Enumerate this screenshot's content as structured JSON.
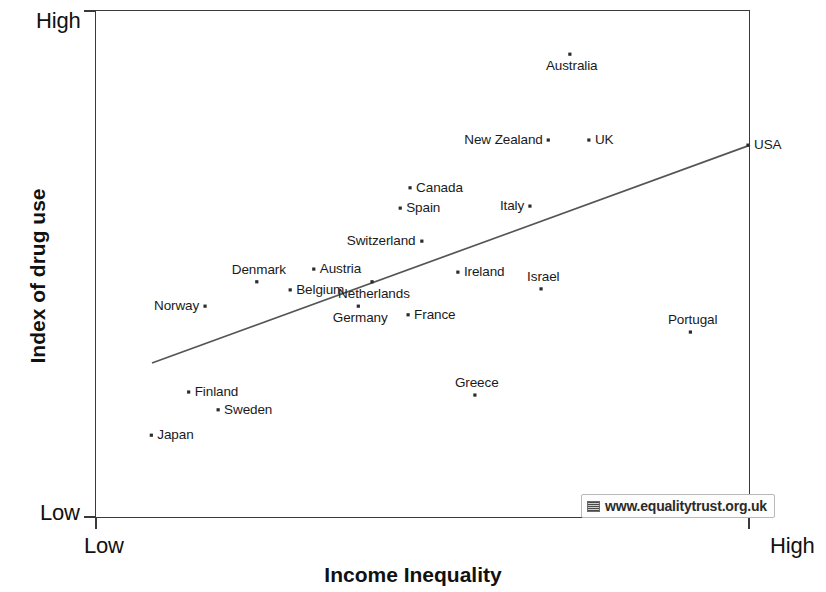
{
  "chart_data": {
    "type": "scatter",
    "title": "",
    "xlabel": "Income Inequality",
    "ylabel": "Index of drug use",
    "x_tick_labels": [
      "Low",
      "High"
    ],
    "y_tick_labels": [
      "High",
      "Low"
    ],
    "xlim": [
      "Low",
      "High"
    ],
    "ylim": [
      "Low",
      "High"
    ],
    "grid": false,
    "legend": "none",
    "trendline": {
      "present": true,
      "x_start": 0.087,
      "y_start": 0.305,
      "x_end": 1.0,
      "y_end": 0.734,
      "description": "upward sloping least-squares regression line"
    },
    "points": [
      {
        "label": "Australia",
        "x": 0.725,
        "y": 0.913,
        "label_pos": "below"
      },
      {
        "label": "New Zealand",
        "x": 0.692,
        "y": 0.744,
        "label_pos": "left"
      },
      {
        "label": "UK",
        "x": 0.754,
        "y": 0.744,
        "label_pos": "right"
      },
      {
        "label": "USA",
        "x": 0.997,
        "y": 0.734,
        "label_pos": "right"
      },
      {
        "label": "Canada",
        "x": 0.481,
        "y": 0.65,
        "label_pos": "right"
      },
      {
        "label": "Spain",
        "x": 0.466,
        "y": 0.61,
        "label_pos": "right"
      },
      {
        "label": "Italy",
        "x": 0.664,
        "y": 0.614,
        "label_pos": "left"
      },
      {
        "label": "Switzerland",
        "x": 0.499,
        "y": 0.545,
        "label_pos": "left"
      },
      {
        "label": "Austria",
        "x": 0.334,
        "y": 0.49,
        "label_pos": "right"
      },
      {
        "label": "Denmark",
        "x": 0.247,
        "y": 0.465,
        "label_pos": "above"
      },
      {
        "label": "Belgium",
        "x": 0.298,
        "y": 0.449,
        "label_pos": "right"
      },
      {
        "label": "Ireland",
        "x": 0.554,
        "y": 0.484,
        "label_pos": "right"
      },
      {
        "label": "Israel",
        "x": 0.681,
        "y": 0.451,
        "label_pos": "above"
      },
      {
        "label": "Netherlands",
        "x": 0.423,
        "y": 0.465,
        "label_pos": "below"
      },
      {
        "label": "Norway",
        "x": 0.168,
        "y": 0.417,
        "label_pos": "left"
      },
      {
        "label": "Germany",
        "x": 0.402,
        "y": 0.417,
        "label_pos": "below"
      },
      {
        "label": "France",
        "x": 0.478,
        "y": 0.4,
        "label_pos": "right"
      },
      {
        "label": "Portugal",
        "x": 0.909,
        "y": 0.366,
        "label_pos": "above"
      },
      {
        "label": "Finland",
        "x": 0.143,
        "y": 0.248,
        "label_pos": "right"
      },
      {
        "label": "Greece",
        "x": 0.58,
        "y": 0.242,
        "label_pos": "above"
      },
      {
        "label": "Sweden",
        "x": 0.188,
        "y": 0.213,
        "label_pos": "right"
      },
      {
        "label": "Japan",
        "x": 0.086,
        "y": 0.163,
        "label_pos": "right"
      }
    ]
  },
  "axes": {
    "y_high_label": "High",
    "y_low_label": "Low",
    "x_low_label": "Low",
    "x_high_label": "High",
    "x_title": "Income Inequality",
    "y_title": "Index of drug use"
  },
  "watermark": {
    "text": "www.equalitytrust.org.uk",
    "icon": "website-thumbnail-icon"
  },
  "colors": {
    "axis": "#3a3a3a",
    "point": "#2b2b2b",
    "trendline": "#555555",
    "text": "#1a1a1a",
    "background": "#ffffff"
  }
}
